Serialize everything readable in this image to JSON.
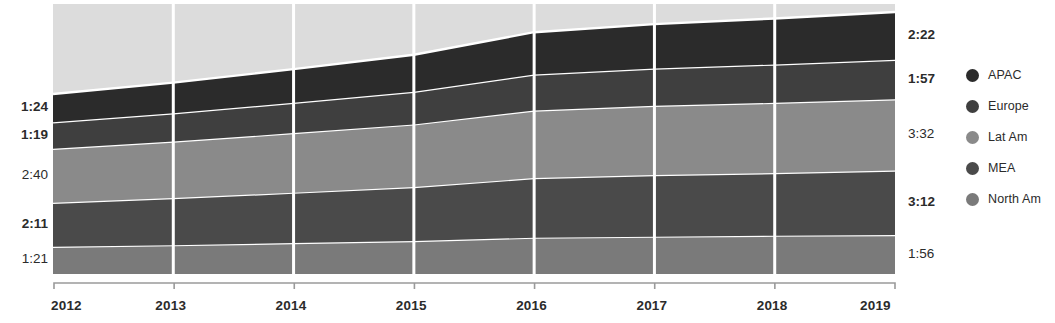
{
  "chart_data": {
    "type": "area",
    "title": "",
    "xlabel": "",
    "ylabel": "",
    "stacked": true,
    "grid": false,
    "legend_position": "right",
    "x": [
      "2012",
      "2013",
      "2014",
      "2015",
      "2016",
      "2017",
      "2018",
      "2019"
    ],
    "categories": [
      "2012",
      "2013",
      "2014",
      "2015",
      "2016",
      "2017",
      "2018",
      "2019"
    ],
    "series": [
      {
        "name": "APAC",
        "color": "#2b2b2b",
        "start_label": "1:24",
        "end_label": "2:22",
        "values": [
          1.4,
          1.52,
          1.67,
          1.83,
          2.1,
          2.2,
          2.28,
          2.37
        ]
      },
      {
        "name": "Europe",
        "color": "#3f3f3f",
        "start_label": "1:19",
        "end_label": "1:57",
        "values": [
          1.32,
          1.4,
          1.5,
          1.62,
          1.78,
          1.85,
          1.9,
          1.95
        ]
      },
      {
        "name": "Lat Am",
        "color": "#8a8a8a",
        "start_label": "2:40",
        "end_label": "3:32",
        "values": [
          2.67,
          2.8,
          2.95,
          3.1,
          3.35,
          3.43,
          3.48,
          3.53
        ]
      },
      {
        "name": "MEA",
        "color": "#4a4a4a",
        "start_label": "2:11",
        "end_label": "3:12",
        "values": [
          2.18,
          2.33,
          2.5,
          2.68,
          2.95,
          3.05,
          3.1,
          3.2
        ]
      },
      {
        "name": "North Am",
        "color": "#7a7a7a",
        "start_label": "1:21",
        "end_label": "1:56",
        "values": [
          1.35,
          1.43,
          1.53,
          1.63,
          1.8,
          1.85,
          1.9,
          1.93
        ]
      }
    ],
    "plot_background": "#dcdcdc",
    "separator_color": "#ffffff",
    "axis_color": "#9a9a9a",
    "annotations": {
      "left_value_labels": [
        "1:24",
        "1:19",
        "2:40",
        "2:11",
        "1:21"
      ],
      "right_value_labels": [
        "2:22",
        "1:57",
        "3:32",
        "3:12",
        "1:56"
      ]
    }
  },
  "axis": {
    "ticks": [
      "2012",
      "2013",
      "2014",
      "2015",
      "2016",
      "2017",
      "2018",
      "2019"
    ]
  },
  "left_labels": [
    {
      "text": "1:24",
      "bold": true
    },
    {
      "text": "1:19",
      "bold": true
    },
    {
      "text": "2:40",
      "bold": false
    },
    {
      "text": "2:11",
      "bold": true
    },
    {
      "text": "1:21",
      "bold": false
    }
  ],
  "right_labels": [
    {
      "text": "2:22",
      "bold": true
    },
    {
      "text": "1:57",
      "bold": true
    },
    {
      "text": "3:32",
      "bold": false
    },
    {
      "text": "3:12",
      "bold": true
    },
    {
      "text": "1:56",
      "bold": false
    }
  ],
  "legend": {
    "items": [
      {
        "label": "APAC",
        "color": "#2b2b2b"
      },
      {
        "label": "Europe",
        "color": "#3f3f3f"
      },
      {
        "label": "Lat Am",
        "color": "#8a8a8a"
      },
      {
        "label": "MEA",
        "color": "#4a4a4a"
      },
      {
        "label": "North Am",
        "color": "#7a7a7a"
      }
    ]
  }
}
